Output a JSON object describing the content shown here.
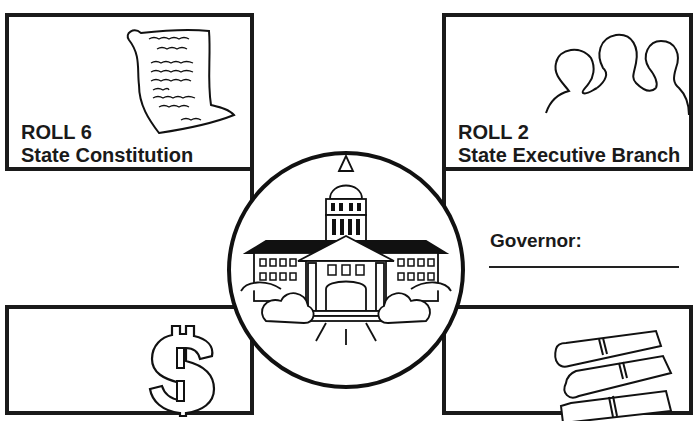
{
  "panels": {
    "top_left": {
      "roll": "ROLL 6",
      "title": "State Constitution",
      "illustration": "scroll-document-icon"
    },
    "top_right": {
      "roll": "ROLL 2",
      "title": "State Executive Branch",
      "illustration": "people-silhouettes-icon"
    },
    "bottom_left": {
      "illustration": "dollar-sign-icon"
    },
    "bottom_right": {
      "illustration": "rolled-scrolls-icon"
    }
  },
  "center": {
    "illustration": "state-capitol-building-icon"
  },
  "governor": {
    "label": "Governor:",
    "value": ""
  },
  "colors": {
    "ink": "#1a1a1a",
    "background": "#ffffff"
  }
}
